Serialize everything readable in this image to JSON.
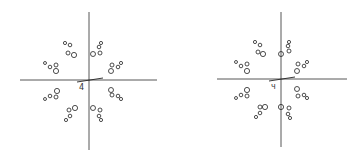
{
  "panels": [
    {
      "id": "left",
      "origin_label": "4",
      "origin": [
        89,
        80
      ],
      "v_axis": [
        89,
        12,
        89,
        150
      ],
      "h_axis": [
        20,
        80,
        157,
        80
      ],
      "clusters": [
        {
          "name": "upper-left-top",
          "circles": [
            [
              65,
              43,
              1.6
            ],
            [
              70,
              45,
              1.8
            ],
            [
              68,
              53,
              2
            ],
            [
              74,
              55,
              2.6
            ]
          ]
        },
        {
          "name": "left-upper",
          "circles": [
            [
              45,
              63,
              1.5
            ],
            [
              50,
              67,
              1.8
            ],
            [
              56,
              65,
              2
            ],
            [
              56,
              71,
              2.6
            ]
          ]
        },
        {
          "name": "upper-right-top",
          "circles": [
            [
              101,
              43,
              1.6
            ],
            [
              99,
              47,
              1.8
            ],
            [
              100,
              53,
              2
            ],
            [
              93,
              54,
              2.5
            ]
          ]
        },
        {
          "name": "right-upper",
          "circles": [
            [
              121,
              63,
              1.6
            ],
            [
              118,
              67,
              1.8
            ],
            [
              112,
              65,
              2
            ],
            [
              111,
              71,
              2.5
            ]
          ]
        },
        {
          "name": "left-lower",
          "circles": [
            [
              45,
              99,
              1.5
            ],
            [
              50,
              96,
              1.8
            ],
            [
              56,
              97,
              2
            ],
            [
              57,
              91,
              2.6
            ]
          ]
        },
        {
          "name": "lower-left-bottom",
          "circles": [
            [
              66,
              120,
              1.6
            ],
            [
              70,
              116,
              1.8
            ],
            [
              69,
              110,
              2
            ],
            [
              75,
              108,
              2.6
            ]
          ]
        },
        {
          "name": "right-lower",
          "circles": [
            [
              121,
              99,
              1.6
            ],
            [
              118,
              96,
              1.8
            ],
            [
              112,
              95,
              2
            ],
            [
              111,
              90,
              2.5
            ]
          ]
        },
        {
          "name": "lower-right-bottom",
          "circles": [
            [
              101,
              120,
              1.6
            ],
            [
              99,
              116,
              1.8
            ],
            [
              100,
              110,
              2
            ],
            [
              93,
              108,
              2.5
            ]
          ]
        }
      ]
    },
    {
      "id": "right",
      "origin_label": "ч",
      "origin": [
        281,
        79
      ],
      "v_axis": [
        281,
        12,
        281,
        147
      ],
      "h_axis": [
        217,
        79,
        347,
        79
      ],
      "clusters": [
        {
          "name": "upper-left-top",
          "circles": [
            [
              255,
              42,
              1.6
            ],
            [
              260,
              45,
              1.8
            ],
            [
              258,
              52,
              2
            ],
            [
              263,
              54,
              2.6
            ]
          ]
        },
        {
          "name": "left-upper",
          "circles": [
            [
              236,
              62,
              1.5
            ],
            [
              241,
              66,
              1.8
            ],
            [
              247,
              64,
              2
            ],
            [
              247,
              71,
              2.6
            ]
          ]
        },
        {
          "name": "upper-right-top",
          "circles": [
            [
              289,
              42,
              1.6
            ],
            [
              288,
              46,
              1.8
            ],
            [
              289,
              51,
              2
            ],
            [
              281,
              54,
              2.5
            ]
          ]
        },
        {
          "name": "right-upper",
          "circles": [
            [
              307,
              62,
              1.6
            ],
            [
              304,
              66,
              1.8
            ],
            [
              298,
              64,
              2
            ],
            [
              297,
              71,
              2.5
            ]
          ]
        },
        {
          "name": "left-lower",
          "circles": [
            [
              236,
              98,
              1.5
            ],
            [
              241,
              95,
              1.8
            ],
            [
              247,
              96,
              2
            ],
            [
              247,
              90,
              2.6
            ]
          ]
        },
        {
          "name": "lower-left-bottom",
          "circles": [
            [
              256,
              117,
              1.6
            ],
            [
              260,
              113,
              1.8
            ],
            [
              260,
              107,
              2
            ],
            [
              265,
              107,
              2.6
            ]
          ]
        },
        {
          "name": "right-lower",
          "circles": [
            [
              307,
              98,
              1.6
            ],
            [
              304,
              95,
              1.8
            ],
            [
              298,
              96,
              2
            ],
            [
              297,
              89,
              2.5
            ]
          ]
        },
        {
          "name": "lower-right-bottom",
          "circles": [
            [
              290,
              118,
              1.6
            ],
            [
              288,
              114,
              1.8
            ],
            [
              289,
              108,
              2
            ],
            [
              281,
              107,
              2.6
            ]
          ]
        }
      ]
    }
  ],
  "colors": {
    "stroke": "#222222",
    "axis": "#444444",
    "background": "#ffffff"
  }
}
